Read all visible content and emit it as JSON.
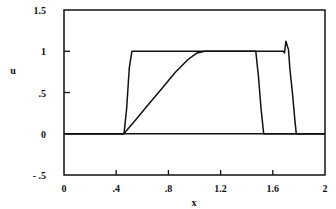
{
  "chart_data": {
    "type": "line",
    "title": "",
    "xlabel": "x",
    "ylabel": "u",
    "xlim": [
      0,
      2
    ],
    "ylim": [
      -0.5,
      1.5
    ],
    "grid": false,
    "legend": "none",
    "x_ticks": [
      {
        "value": 0,
        "label": "0"
      },
      {
        "value": 0.4,
        "label": ".4"
      },
      {
        "value": 0.8,
        "label": ".8"
      },
      {
        "value": 1.2,
        "label": "1.2"
      },
      {
        "value": 1.6,
        "label": "1.6"
      },
      {
        "value": 2,
        "label": "2"
      }
    ],
    "y_ticks": [
      {
        "value": -0.5,
        "label": "- .5"
      },
      {
        "value": 0,
        "label": "0"
      },
      {
        "value": 0.5,
        "label": ".5"
      },
      {
        "value": 1,
        "label": "1"
      },
      {
        "value": 1.5,
        "label": "1.5"
      }
    ],
    "reference_lines": [
      {
        "axis": "y",
        "value": 0
      }
    ],
    "series": [
      {
        "name": "sharp-profile",
        "x": [
          0,
          0.46,
          0.48,
          0.5,
          0.52,
          1.68,
          1.69,
          1.7,
          1.72,
          1.73,
          1.75,
          1.77,
          1.78,
          2
        ],
        "y": [
          0,
          0,
          0.3,
          0.8,
          1,
          1,
          0.98,
          1.12,
          1.02,
          0.8,
          0.5,
          0.15,
          0,
          0
        ]
      },
      {
        "name": "smooth-profile",
        "x": [
          0,
          0.46,
          0.48,
          0.55,
          0.65,
          0.75,
          0.85,
          0.95,
          1.02,
          1.08,
          1.47,
          1.49,
          1.51,
          1.53,
          2
        ],
        "y": [
          0,
          0,
          0.04,
          0.17,
          0.36,
          0.55,
          0.74,
          0.9,
          0.98,
          1,
          1,
          0.7,
          0.3,
          0,
          0
        ]
      }
    ]
  }
}
